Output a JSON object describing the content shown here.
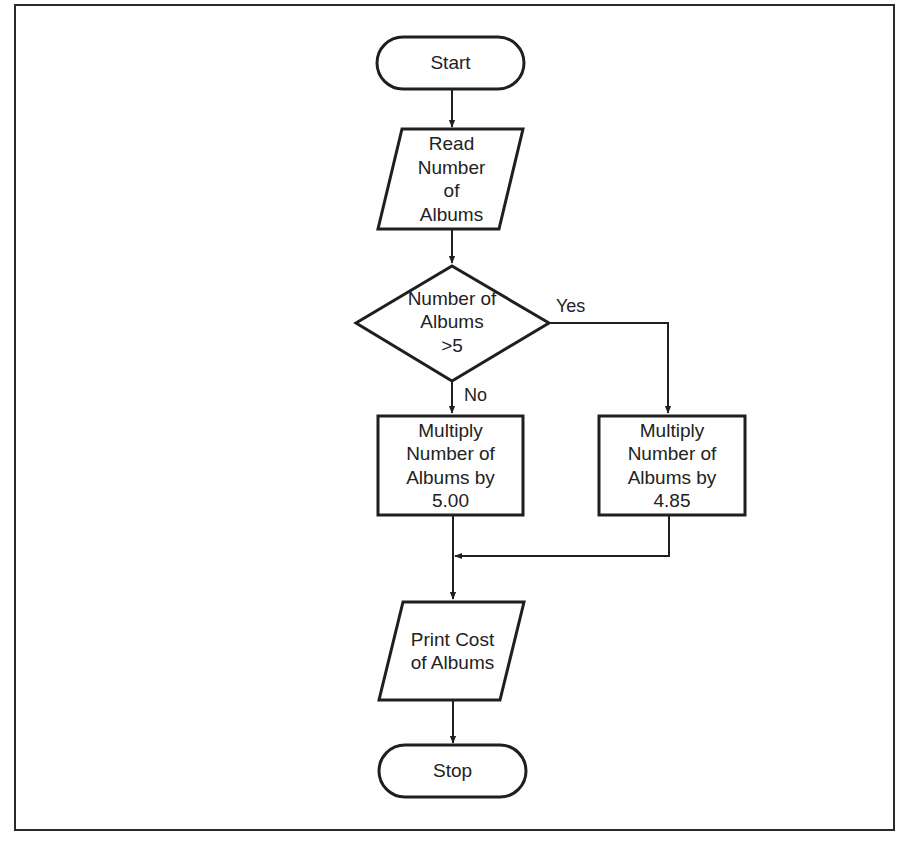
{
  "diagram": {
    "type": "flowchart",
    "nodes": {
      "start": {
        "shape": "terminal",
        "lines": [
          "Start"
        ]
      },
      "read": {
        "shape": "input-output",
        "lines": [
          "Read",
          "Number",
          "of",
          "Albums"
        ]
      },
      "decision": {
        "shape": "decision",
        "lines": [
          "Number of",
          "Albums",
          ">5"
        ]
      },
      "multiply_no": {
        "shape": "process",
        "lines": [
          "Multiply",
          "Number of",
          "Albums by",
          "5.00"
        ]
      },
      "multiply_yes": {
        "shape": "process",
        "lines": [
          "Multiply",
          "Number of",
          "Albums by",
          "4.85"
        ]
      },
      "print": {
        "shape": "input-output",
        "lines": [
          "Print Cost",
          "of Albums"
        ]
      },
      "stop": {
        "shape": "terminal",
        "lines": [
          "Stop"
        ]
      }
    },
    "edges": [
      {
        "from": "start",
        "to": "read",
        "label": ""
      },
      {
        "from": "read",
        "to": "decision",
        "label": ""
      },
      {
        "from": "decision",
        "to": "multiply_no",
        "label": "No"
      },
      {
        "from": "decision",
        "to": "multiply_yes",
        "label": "Yes"
      },
      {
        "from": "multiply_no",
        "to": "print",
        "label": ""
      },
      {
        "from": "multiply_yes",
        "to": "print",
        "label": ""
      },
      {
        "from": "print",
        "to": "stop",
        "label": ""
      }
    ],
    "edge_labels": {
      "yes": "Yes",
      "no": "No"
    },
    "colors": {
      "stroke": "#1f1f1f",
      "background": "#ffffff",
      "text": "#222222"
    }
  }
}
